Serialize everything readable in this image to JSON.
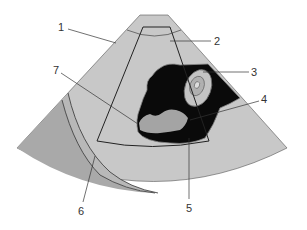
{
  "diagram": {
    "type": "ultrasound-sector-schematic",
    "labels": [
      {
        "id": "1",
        "text": "1"
      },
      {
        "id": "2",
        "text": "2"
      },
      {
        "id": "3",
        "text": "3"
      },
      {
        "id": "4",
        "text": "4"
      },
      {
        "id": "5",
        "text": "5"
      },
      {
        "id": "6",
        "text": "6"
      },
      {
        "id": "7",
        "text": "7"
      }
    ],
    "colors": {
      "sector_fill": "#c8c8c8",
      "outer_layer_fill": "#a9a9a9",
      "middle_layer_fill": "#b5b5b5",
      "mass_fill": "#0a0a0a",
      "grey_region_fill": "#a4a4a4",
      "structure_fill": "#c4c4c4",
      "outline": "#333333"
    }
  }
}
